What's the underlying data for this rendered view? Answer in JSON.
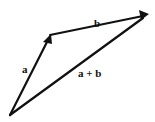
{
  "diagram": {
    "vectors": [
      {
        "id": "a",
        "label": "a",
        "from": "origin",
        "to": "tip-a"
      },
      {
        "id": "b",
        "label": "b",
        "from": "tip-a",
        "to": "tip-b"
      },
      {
        "id": "sum",
        "label": "a + b",
        "from": "origin",
        "to": "tip-b"
      }
    ],
    "color": "#111111"
  }
}
